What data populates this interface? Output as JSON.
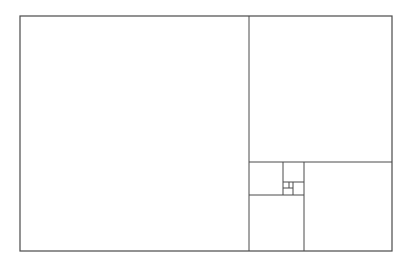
{
  "diagram": {
    "type": "golden-rectangle-subdivision",
    "stroke_color": "#4a4a4a",
    "background": "#ffffff",
    "outer": {
      "x": 20,
      "y": 16,
      "w": 372,
      "h": 235
    },
    "lines": [
      {
        "x1": 249,
        "y1": 16,
        "x2": 249,
        "y2": 251
      },
      {
        "x1": 249,
        "y1": 162,
        "x2": 392,
        "y2": 162
      },
      {
        "x1": 304,
        "y1": 162,
        "x2": 304,
        "y2": 251
      },
      {
        "x1": 249,
        "y1": 195,
        "x2": 304,
        "y2": 195
      },
      {
        "x1": 283,
        "y1": 162,
        "x2": 283,
        "y2": 195
      },
      {
        "x1": 283,
        "y1": 182,
        "x2": 304,
        "y2": 182
      },
      {
        "x1": 293,
        "y1": 182,
        "x2": 293,
        "y2": 195
      },
      {
        "x1": 283,
        "y1": 188,
        "x2": 293,
        "y2": 188
      },
      {
        "x1": 289,
        "y1": 182,
        "x2": 289,
        "y2": 188
      }
    ]
  }
}
